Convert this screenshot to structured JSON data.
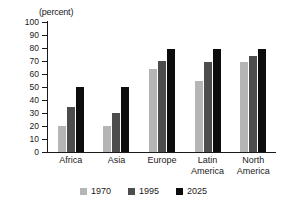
{
  "chart_data": {
    "type": "bar",
    "title": "",
    "subtitle": "",
    "unit_label": "(percent)",
    "xlabel": "",
    "ylabel": "",
    "ylim": [
      0,
      100
    ],
    "ytick_step": 10,
    "yticks": [
      100,
      90,
      80,
      70,
      60,
      50,
      40,
      30,
      20,
      10,
      0
    ],
    "grid": false,
    "legend_position": "bottom-center",
    "categories": [
      "Africa",
      "Asia",
      "Europe",
      "Latin America",
      "North America"
    ],
    "series": [
      {
        "name": "1970",
        "color": "#b5b5b5",
        "values": [
          20,
          20,
          64,
          55,
          69
        ]
      },
      {
        "name": "1995",
        "color": "#4d4d4d",
        "values": [
          35,
          30,
          70,
          69,
          74
        ]
      },
      {
        "name": "2025",
        "color": "#0d0d0d",
        "values": [
          50,
          50,
          79,
          79,
          79
        ]
      }
    ],
    "annotations": []
  },
  "axis": {
    "tick_labels": [
      "100",
      "90",
      "80",
      "70",
      "60",
      "50",
      "40",
      "30",
      "20",
      "10",
      "0"
    ]
  },
  "category_labels": [
    {
      "line1": "Africa",
      "line2": ""
    },
    {
      "line1": "Asia",
      "line2": ""
    },
    {
      "line1": "Europe",
      "line2": ""
    },
    {
      "line1": "Latin",
      "line2": "America"
    },
    {
      "line1": "North",
      "line2": "America"
    }
  ],
  "legend": {
    "items": [
      {
        "label": "1970",
        "color": "#b5b5b5"
      },
      {
        "label": "1995",
        "color": "#4d4d4d"
      },
      {
        "label": "2025",
        "color": "#0d0d0d"
      }
    ]
  }
}
